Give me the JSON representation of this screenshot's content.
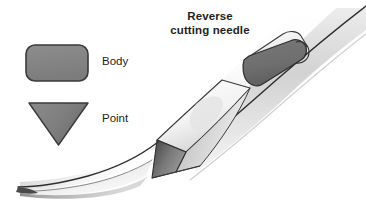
{
  "figure": {
    "kind": "medical-illustration",
    "background_color": "#ffffff",
    "text_color": "#231f20",
    "width": 366,
    "height": 202
  },
  "title": {
    "line1": "Reverse",
    "line2": "cutting needle",
    "full": "Reverse cutting needle"
  },
  "legend": {
    "items": [
      {
        "key": "body",
        "label": "Body",
        "shape": "rounded-rectangle",
        "fill_color": "#848484",
        "stroke_color": "#3a3a3a",
        "description": "Needle body cross-section"
      },
      {
        "key": "point",
        "label": "Point",
        "shape": "down-triangle",
        "fill_color": "#7e7e7e",
        "stroke_color": "#3a3a3a",
        "description": "Needle point cross-section"
      }
    ]
  },
  "needle": {
    "shaft_color_light": "#fdfdfd",
    "shaft_color_shade": "#d8d8d8",
    "edge_color": "#2f2f2f",
    "body_face_color": "#6f6f6f",
    "point_face_color": "#6a6a6a",
    "guide_line_color": "#e2e2e2",
    "segments": [
      {
        "key": "tip",
        "name": "needle-tip"
      },
      {
        "key": "point-section",
        "name": "point-cross-section"
      },
      {
        "key": "body-section",
        "name": "body-cross-section"
      },
      {
        "key": "shaft",
        "name": "curved-shaft"
      }
    ]
  }
}
